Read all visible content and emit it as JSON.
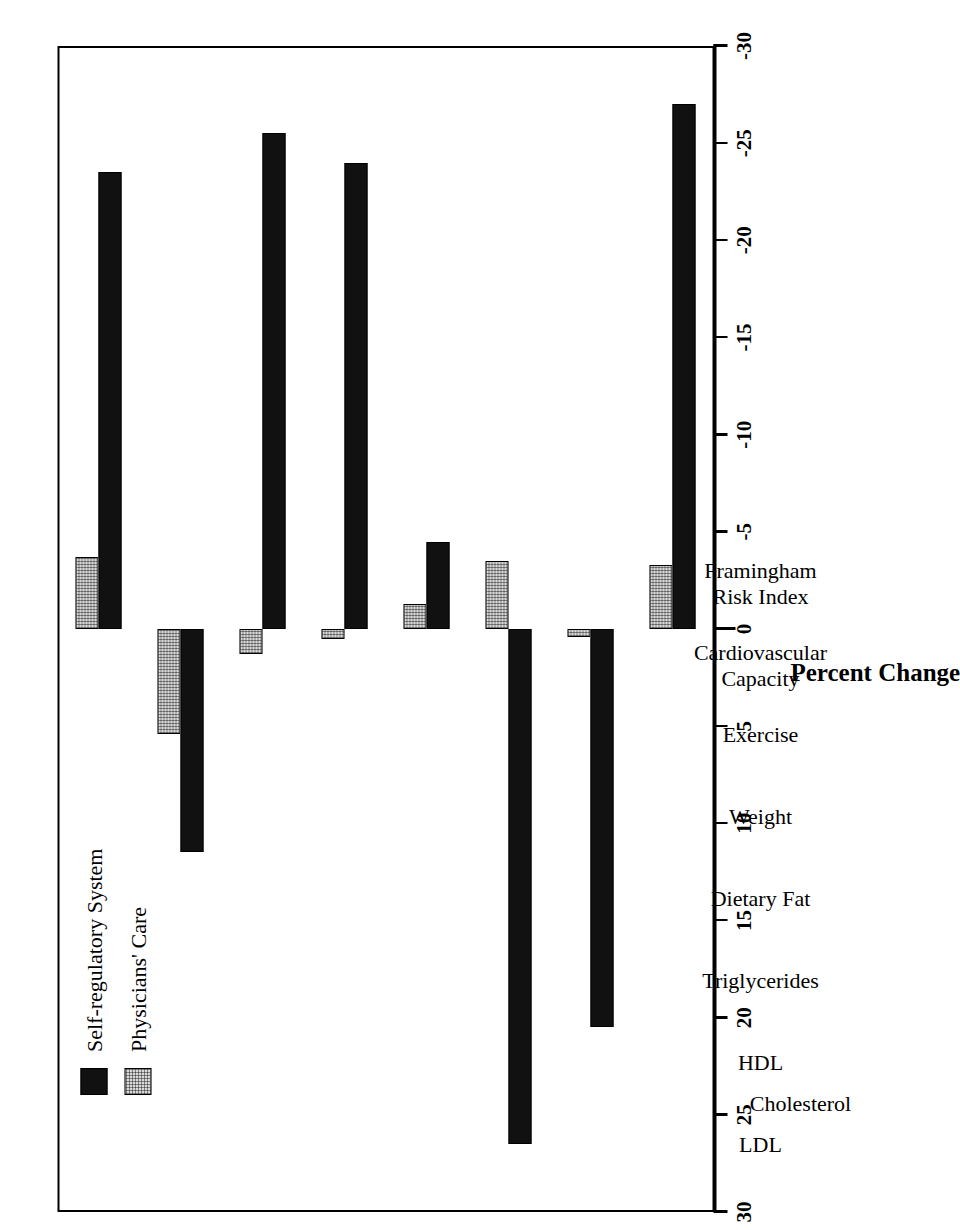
{
  "chart_data": {
    "type": "bar",
    "title": "",
    "orientation": "vertical-grouped",
    "xlabel": "",
    "ylabel": "Percent Change",
    "ylim": [
      -30,
      30
    ],
    "yticks": [
      30,
      25,
      20,
      15,
      10,
      5,
      0,
      -5,
      -10,
      -15,
      -20,
      -25,
      -30
    ],
    "ytick_labels": [
      "30",
      "25",
      "20",
      "15",
      "10",
      "5",
      "0",
      "-5",
      "-10",
      "-15",
      "-20",
      "-25",
      "-30"
    ],
    "grid": false,
    "legend_position": "upper-left",
    "categories": [
      "LDL",
      "HDL",
      "Triglycerides",
      "Dietary Fat",
      "Weight",
      "Exercise",
      "Cardiovascular Capacity",
      "Framingham Risk Index"
    ],
    "category_lines": [
      [
        "LDL"
      ],
      [
        "HDL"
      ],
      [
        "Triglycerides"
      ],
      [
        "Dietary Fat"
      ],
      [
        "Weight"
      ],
      [
        "Exercise"
      ],
      [
        "Cardiovascular",
        "Capacity"
      ],
      [
        "Framingham",
        "Risk Index"
      ]
    ],
    "group_labels": [
      {
        "text": "Cholesterol",
        "spans": [
          "LDL",
          "HDL"
        ]
      }
    ],
    "series": [
      {
        "name": "Self-regulatory System",
        "color": "#111111",
        "pattern": "solid",
        "values": [
          -23.5,
          11.5,
          -25.5,
          -24.0,
          -4.5,
          26.5,
          20.5,
          -27.0
        ]
      },
      {
        "name": "Physicians' Care",
        "color": "#d9d9d9",
        "pattern": "stipple",
        "values": [
          -3.7,
          5.4,
          1.3,
          0.5,
          -1.3,
          -3.5,
          0.4,
          -3.3
        ]
      }
    ]
  },
  "legend": {
    "entries": [
      {
        "label": "Self-regulatory System",
        "swatch": "dark-square-swatch"
      },
      {
        "label": "Physicians' Care",
        "swatch": "stippled-square-swatch"
      }
    ]
  },
  "axis": {
    "y_title": "Percent Change"
  }
}
